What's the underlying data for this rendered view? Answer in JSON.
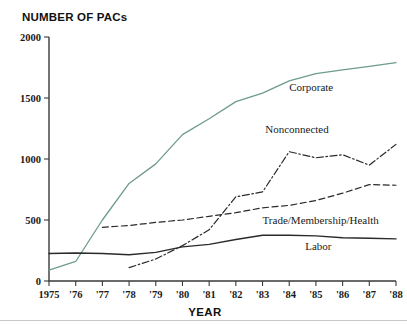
{
  "chart_data": {
    "type": "line",
    "title": "NUMBER OF PACs",
    "subtitle": "",
    "xlabel": "YEAR",
    "ylabel": "NUMBER OF PACs",
    "grid": false,
    "legend_position": "inline-labels",
    "x": [
      1975,
      1976,
      1977,
      1978,
      1979,
      1980,
      1981,
      1982,
      1983,
      1984,
      1985,
      1986,
      1987,
      1988
    ],
    "xtick_labels": [
      "1975",
      "'76",
      "'77",
      "'78",
      "'79",
      "'80",
      "'81",
      "'82",
      "'83",
      "'84",
      "'85",
      "'86",
      "'87",
      "'88"
    ],
    "xlim": [
      1975,
      1988
    ],
    "ylim": [
      0,
      2000
    ],
    "ytick_labels": [
      "0",
      "500",
      "1000",
      "1500",
      "2000"
    ],
    "ytick_values": [
      0,
      500,
      1000,
      1500,
      2000
    ],
    "series": [
      {
        "name": "Corporate",
        "color": "#6e9b8c",
        "style": "solid",
        "width": 1.3,
        "label_x": 1984.0,
        "label_y": 1560,
        "x": [
          1975,
          1976,
          1977,
          1978,
          1979,
          1980,
          1981,
          1982,
          1983,
          1984,
          1985,
          1986,
          1987,
          1988
        ],
        "values": [
          90,
          160,
          500,
          800,
          960,
          1200,
          1330,
          1470,
          1540,
          1640,
          1700,
          1730,
          1760,
          1790
        ]
      },
      {
        "name": "Nonconnected",
        "color": "#2a2a2a",
        "style": "dashdot",
        "width": 1.2,
        "label_x": 1983.1,
        "label_y": 1215,
        "x": [
          1978,
          1979,
          1980,
          1981,
          1982,
          1983,
          1984,
          1985,
          1986,
          1987,
          1988
        ],
        "values": [
          110,
          180,
          290,
          420,
          690,
          730,
          1060,
          1010,
          1035,
          950,
          1120
        ]
      },
      {
        "name": "Trade/Membership/Health",
        "color": "#2a2a2a",
        "style": "dashed",
        "width": 1.2,
        "label_x": 1983.0,
        "label_y": 470,
        "x": [
          1977,
          1978,
          1979,
          1980,
          1981,
          1982,
          1983,
          1984,
          1985,
          1986,
          1987,
          1988
        ],
        "values": [
          440,
          455,
          480,
          500,
          530,
          560,
          600,
          620,
          660,
          720,
          790,
          785
        ]
      },
      {
        "name": "Labor",
        "color": "#2a2a2a",
        "style": "solid",
        "width": 1.4,
        "label_x": 1984.6,
        "label_y": 255,
        "x": [
          1975,
          1976,
          1977,
          1978,
          1979,
          1980,
          1981,
          1982,
          1983,
          1984,
          1985,
          1986,
          1987,
          1988
        ],
        "values": [
          225,
          230,
          225,
          215,
          235,
          280,
          300,
          340,
          375,
          375,
          370,
          355,
          350,
          345
        ]
      }
    ]
  }
}
